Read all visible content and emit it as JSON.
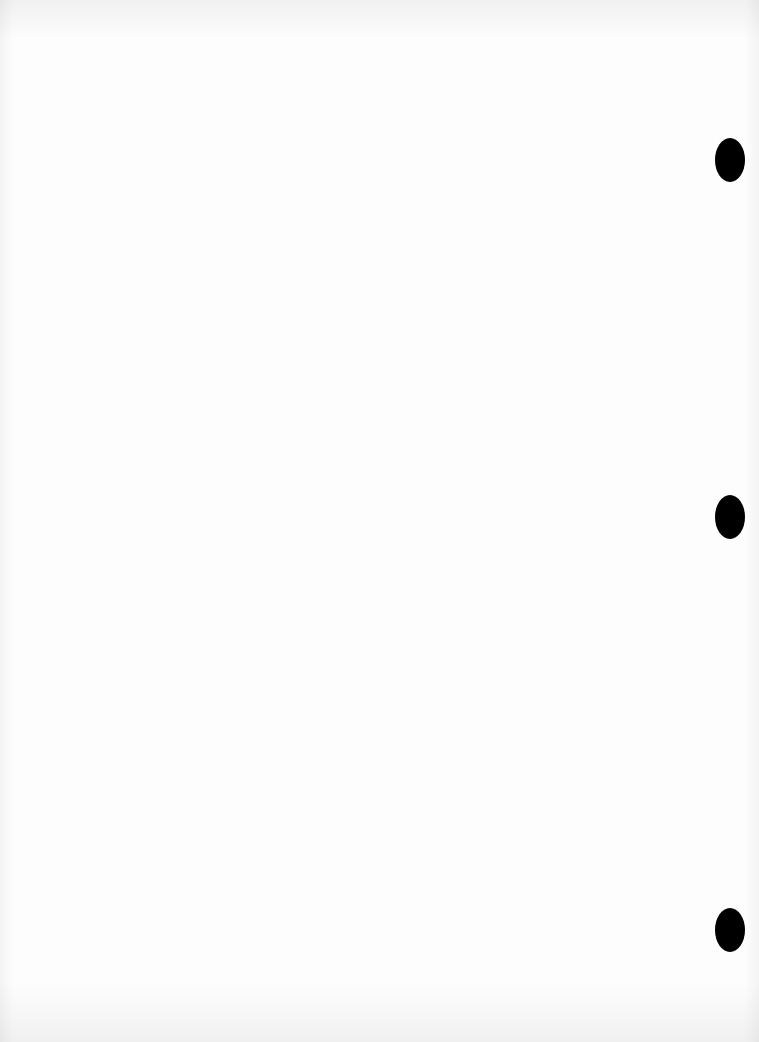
{
  "document": {
    "type": "blank scanned page",
    "text": "",
    "colors": {
      "paper": "#fdfdfd",
      "hole": "#000000"
    },
    "punch_holes": [
      {
        "cx": 730,
        "cy": 160
      },
      {
        "cx": 730,
        "cy": 517
      },
      {
        "cx": 730,
        "cy": 930
      }
    ]
  }
}
